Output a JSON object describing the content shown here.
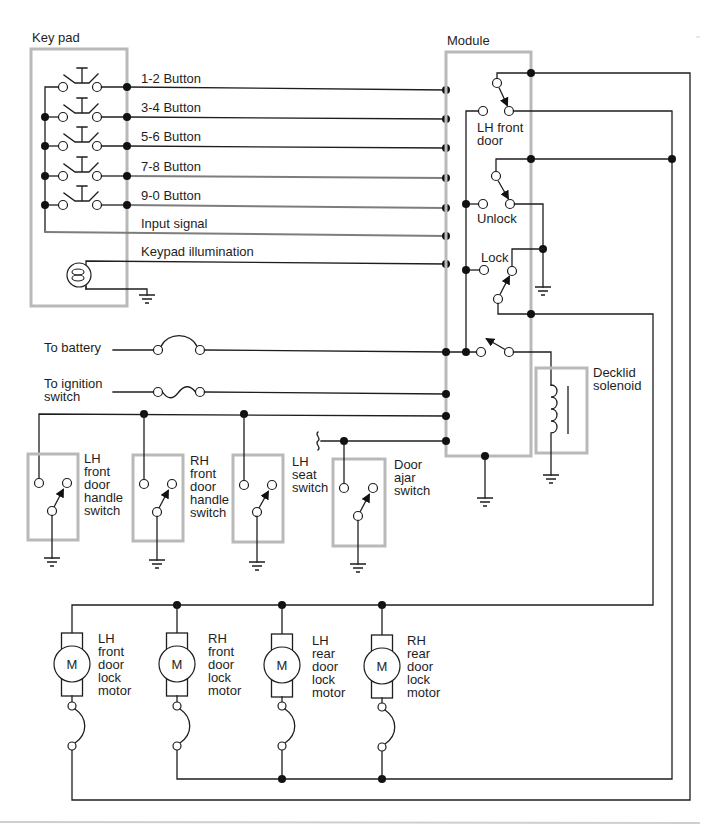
{
  "keypad": {
    "title": "Key pad",
    "buttons": [
      "1-2 Button",
      "3-4 Button",
      "5-6 Button",
      "7-8 Button",
      "9-0 Button"
    ],
    "input_signal": "Input signal",
    "illumination": "Keypad illumination"
  },
  "module": {
    "title": "Module",
    "lh_front_door": [
      "LH front",
      "door"
    ],
    "unlock": "Unlock",
    "lock": "Lock"
  },
  "power": {
    "battery": "To battery",
    "ignition": [
      "To ignition",
      "switch"
    ]
  },
  "decklid": [
    "Decklid",
    "solenoid"
  ],
  "switches": [
    {
      "lines": [
        "LH",
        "front",
        "door",
        "handle",
        "switch"
      ]
    },
    {
      "lines": [
        "RH",
        "front",
        "door",
        "handle",
        "switch"
      ]
    },
    {
      "lines": [
        "LH",
        "seat",
        "switch"
      ]
    },
    {
      "lines": [
        "Door",
        "ajar",
        "switch"
      ]
    }
  ],
  "motors": [
    {
      "symbol": "M",
      "lines": [
        "LH",
        "front",
        "door",
        "lock",
        "motor"
      ]
    },
    {
      "symbol": "M",
      "lines": [
        "RH",
        "front",
        "door",
        "lock",
        "motor"
      ]
    },
    {
      "symbol": "M",
      "lines": [
        "LH",
        "rear",
        "door",
        "lock",
        "motor"
      ]
    },
    {
      "symbol": "M",
      "lines": [
        "RH",
        "rear",
        "door",
        "lock",
        "motor"
      ]
    }
  ],
  "colors": {
    "wire": "#1e1e1e",
    "signal_wire": "#7d7d7d",
    "component_outline": "#b9b9b9"
  }
}
